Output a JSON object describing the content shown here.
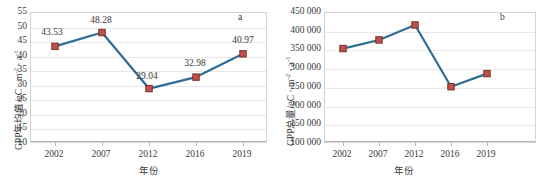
{
  "figure": {
    "background": "#ffffff",
    "line_color": "#2E6C95",
    "marker_fill": "#C0504D",
    "marker_stroke": "#7a2f1f",
    "grid_color": "#e8e8e8",
    "axis_color": "#b8b8b8"
  },
  "chart_data": [
    {
      "type": "line",
      "panel": "a",
      "panel_label": "a",
      "title": "",
      "xlabel": "年份",
      "ylabel": "GPP年均值/gC·m⁻²·a⁻¹",
      "ylabel_parts": {
        "pre": "GPP年均值/gC · m",
        "sup1": "-2",
        "mid": " · a",
        "sup2": "-1"
      },
      "categories": [
        "2002",
        "2007",
        "2012",
        "2016",
        "2019"
      ],
      "values": [
        43.53,
        48.28,
        29.04,
        32.98,
        40.97
      ],
      "data_labels": [
        "43.53",
        "48.28",
        "29.04",
        "32.98",
        "40.97"
      ],
      "ylim": [
        10,
        55
      ],
      "yticks": [
        55,
        50,
        45,
        40,
        35,
        30,
        25,
        20,
        15,
        10
      ],
      "ytick_labels": [
        "55",
        "50",
        "45",
        "40",
        "35",
        "30",
        "25",
        "20",
        "15",
        "10"
      ],
      "grid": true,
      "legend": "none"
    },
    {
      "type": "line",
      "panel": "b",
      "panel_label": "b",
      "title": "",
      "xlabel": "年份",
      "ylabel": "GPP总量/gC·m⁻²·a⁻¹",
      "ylabel_parts": {
        "pre": "GPP总量/gC · m",
        "sup1": "-2",
        "mid": " · a",
        "sup2": "-1"
      },
      "categories": [
        "2002",
        "2007",
        "2012",
        "2016",
        "2019"
      ],
      "values": [
        355000,
        378000,
        418000,
        253000,
        288000
      ],
      "data_labels": [],
      "ylim": [
        100000,
        450000
      ],
      "yticks": [
        450000,
        400000,
        350000,
        300000,
        250000,
        200000,
        150000,
        100000
      ],
      "ytick_labels": [
        "450 000",
        "400 000",
        "350 000",
        "300 000",
        "250 000",
        "200 000",
        "150 000",
        "100 000"
      ],
      "grid": true,
      "legend": "none"
    }
  ]
}
